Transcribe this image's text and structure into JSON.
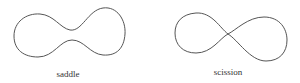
{
  "diagram": {
    "stroke_color": "#555555",
    "shapes": [
      {
        "name": "saddle",
        "label": "saddle"
      },
      {
        "name": "scission",
        "label": "scission"
      }
    ]
  }
}
